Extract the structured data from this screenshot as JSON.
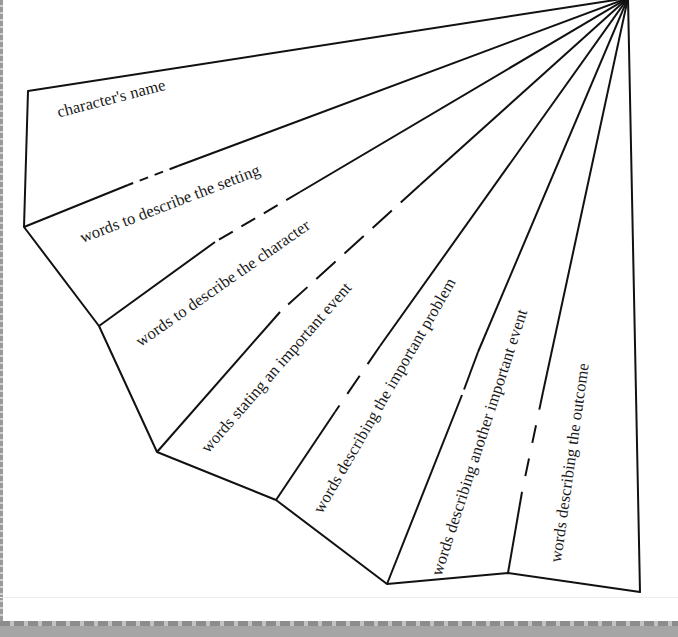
{
  "diagram": {
    "type": "fan-fold-organizer",
    "stroke_color": "#111111",
    "apex": [
      628,
      0
    ],
    "outer_vertices": [
      [
        28,
        91
      ],
      [
        24,
        227
      ],
      [
        99,
        326
      ],
      [
        157,
        452
      ],
      [
        276,
        500
      ],
      [
        387,
        584
      ],
      [
        508,
        573
      ],
      [
        640,
        592
      ]
    ],
    "sections": [
      {
        "id": "name",
        "label": "character's name"
      },
      {
        "id": "setting",
        "label": "words to describe the setting"
      },
      {
        "id": "character",
        "label": "words to describe the character"
      },
      {
        "id": "event",
        "label": "words stating an important event"
      },
      {
        "id": "problem",
        "label": "words describing the important problem"
      },
      {
        "id": "another-event",
        "label": "words describing another important event"
      },
      {
        "id": "outcome",
        "label": "words describing the outcome"
      }
    ]
  }
}
